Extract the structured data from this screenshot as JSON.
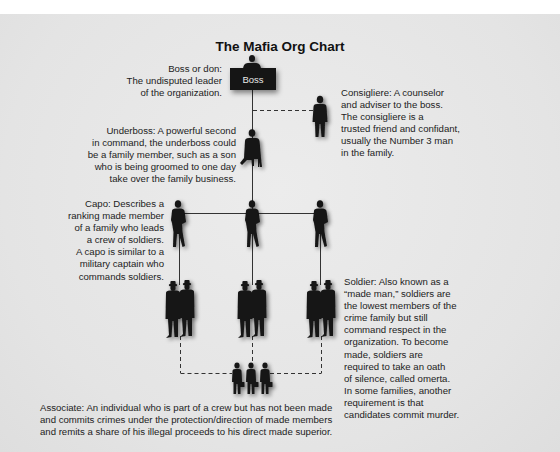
{
  "chart_title": "The Mafia Org Chart",
  "boss": {
    "box_label": "Boss",
    "description": "Boss or don:\nThe undisputed leader\nof the organization."
  },
  "consigliere": {
    "description": "Consigliere: A counselor\nand adviser to the boss.\nThe consigliere is a\ntrusted friend and confidant,\nusually the Number 3 man\nin the family."
  },
  "underboss": {
    "description": "Underboss: A powerful second\nin command, the underboss could\nbe a family member, such as a son\nwho is being groomed to one day\ntake over the family business."
  },
  "capo": {
    "count": 3,
    "description": "Capo: Describes a\nranking made member\nof a family who leads\na crew of soldiers.\nA capo is similar to a\nmilitary captain who\ncommands soldiers."
  },
  "soldier": {
    "groups": 3,
    "per_group": 2,
    "description": "Soldier: Also known as a\n“made man,” soldiers are\nthe lowest members of the\ncrime family but still\ncommand respect in the\norganization. To become\nmade, soldiers are\nrequired to take an oath\nof silence, called omerta.\nIn some families, another\nrequirement is that\ncandidates commit murder."
  },
  "associate": {
    "count": 3,
    "description": "Associate: An individual who is part of a crew but has not been made\nand commits crimes under the protection/direction of made members\nand remits a share of his illegal proceeds to his direct made superior."
  },
  "colors": {
    "background": "#e7e7e7",
    "figure": "#141414",
    "line": "#333333",
    "text": "#222222"
  }
}
